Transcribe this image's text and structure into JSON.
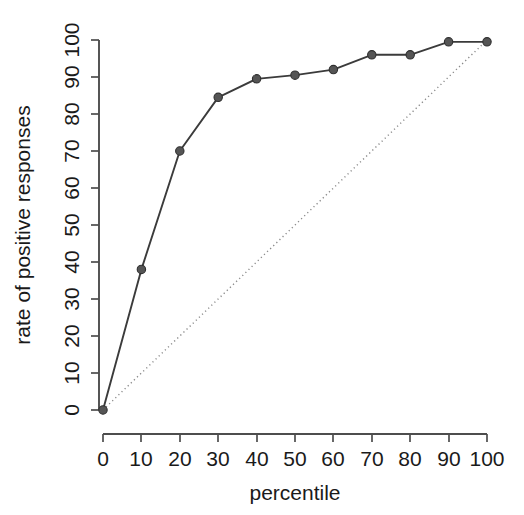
{
  "figure": {
    "width": 524,
    "height": 515,
    "background": "#ffffff",
    "line_color": "#3b3b3b",
    "point_color": "#555555",
    "reference_line_color": "#8a8a8a",
    "axis_color": "#4d4d4d",
    "text_color": "#1a1a1a"
  },
  "chart_data": {
    "type": "line",
    "title": "",
    "subtitle": "",
    "xlabel": "percentile",
    "ylabel": "rate of positive responses",
    "x": [
      0,
      10,
      20,
      30,
      40,
      50,
      60,
      70,
      80,
      90,
      100
    ],
    "series": [
      {
        "name": "rate of positive responses",
        "values": [
          0,
          38,
          70,
          84.5,
          89.5,
          90.5,
          92,
          96,
          96,
          99.5,
          99.5
        ],
        "marker": "filled-circle",
        "linestyle": "solid"
      },
      {
        "name": "reference diagonal",
        "values": [
          0,
          10,
          20,
          30,
          40,
          50,
          60,
          70,
          80,
          90,
          100
        ],
        "marker": "none",
        "linestyle": "dotted"
      }
    ],
    "xlim": [
      0,
      100
    ],
    "ylim": [
      0,
      100
    ],
    "xticks": [
      0,
      10,
      20,
      30,
      40,
      50,
      60,
      70,
      80,
      90,
      100
    ],
    "yticks": [
      0,
      10,
      20,
      30,
      40,
      50,
      60,
      70,
      80,
      90,
      100
    ],
    "xticklabels": [
      "0",
      "10",
      "20",
      "30",
      "40",
      "50",
      "60",
      "70",
      "80",
      "90",
      "100"
    ],
    "yticklabels": [
      "0",
      "10",
      "20",
      "30",
      "40",
      "50",
      "60",
      "70",
      "80",
      "90",
      "100"
    ],
    "grid": false,
    "legend": false,
    "legend_position": "none",
    "tick_label_rotation_deg": -90,
    "annotations": []
  },
  "axes": {
    "x_title": "percentile",
    "y_title": "rate of positive responses"
  }
}
